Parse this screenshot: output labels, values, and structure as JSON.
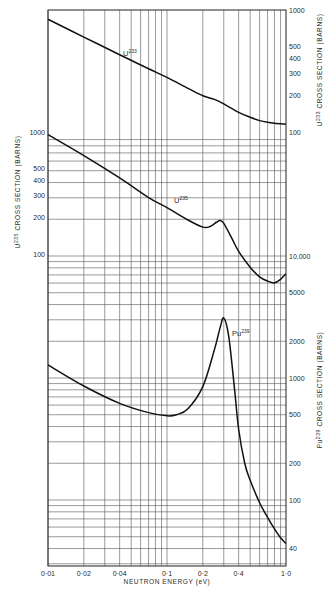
{
  "chart_data": {
    "type": "line",
    "title": "",
    "xlabel": "NEUTRON ENERGY (eV)",
    "x_scale": "log",
    "xlim": [
      0.01,
      1.0
    ],
    "x_tick_labels": [
      "0·01",
      "0·02",
      "0·04",
      "0·1",
      "0·2",
      "0·4",
      "1·0"
    ],
    "x_ticks": [
      0.01,
      0.02,
      0.04,
      0.1,
      0.2,
      0.4,
      1.0
    ],
    "grid": true,
    "axes": [
      {
        "id": "u233",
        "side": "right",
        "label": "U233 CROSS SECTION (BARNS)",
        "label_base": "U",
        "label_sup": "233",
        "label_rest": "CROSS SECTION (BARNS)",
        "scale": "log",
        "tick_labels": [
          "1000",
          "500",
          "400",
          "300",
          "200",
          "100"
        ],
        "ticks": [
          1000,
          500,
          400,
          300,
          200,
          100
        ]
      },
      {
        "id": "u235",
        "side": "left",
        "label": "U235 CROSS SECTION (BARNS)",
        "label_base": "U",
        "label_sup": "235",
        "label_rest": "CROSS SECTION (BARNS)",
        "scale": "log",
        "tick_labels": [
          "1000",
          "500",
          "400",
          "300",
          "200",
          "100"
        ],
        "ticks": [
          1000,
          500,
          400,
          300,
          200,
          100
        ]
      },
      {
        "id": "pu239",
        "side": "right",
        "label": "Pu239 CROSS SECTION (BARNS)",
        "label_base": "Pu",
        "label_sup": "239",
        "label_rest": "CROSS SECTION (BARNS)",
        "scale": "log",
        "tick_labels": [
          "10,000",
          "5000",
          "2000",
          "1000",
          "500",
          "200",
          "100",
          "40"
        ],
        "ticks": [
          10000,
          5000,
          2000,
          1000,
          500,
          200,
          100,
          40
        ]
      }
    ],
    "series": [
      {
        "name": "U233",
        "label_base": "U",
        "label_sup": "233",
        "axis": "u233",
        "x": [
          0.01,
          0.02,
          0.04,
          0.07,
          0.1,
          0.15,
          0.2,
          0.25,
          0.3,
          0.4,
          0.5,
          0.6,
          0.7,
          0.8,
          1.0
        ],
        "values": [
          840,
          600,
          430,
          330,
          280,
          228,
          198,
          185,
          170,
          145,
          132,
          124,
          120,
          118,
          116
        ]
      },
      {
        "name": "U235",
        "label_base": "U",
        "label_sup": "235",
        "axis": "u235",
        "x": [
          0.01,
          0.02,
          0.04,
          0.07,
          0.1,
          0.15,
          0.2,
          0.23,
          0.26,
          0.28,
          0.3,
          0.35,
          0.4,
          0.5,
          0.6,
          0.7,
          0.8,
          0.9,
          1.0
        ],
        "values": [
          950,
          640,
          420,
          290,
          240,
          190,
          166,
          168,
          182,
          188,
          178,
          135,
          105,
          78,
          65,
          60,
          58,
          62,
          69
        ]
      },
      {
        "name": "Pu239",
        "label_base": "Pu",
        "label_sup": "239",
        "axis": "pu239",
        "x": [
          0.01,
          0.02,
          0.04,
          0.07,
          0.1,
          0.12,
          0.15,
          0.2,
          0.25,
          0.28,
          0.3,
          0.33,
          0.37,
          0.4,
          0.45,
          0.5,
          0.6,
          0.7,
          0.8,
          0.9,
          1.0
        ],
        "values": [
          1280,
          860,
          620,
          520,
          490,
          500,
          560,
          850,
          1700,
          2600,
          3100,
          2200,
          800,
          380,
          200,
          145,
          95,
          72,
          58,
          49,
          44
        ]
      }
    ]
  }
}
